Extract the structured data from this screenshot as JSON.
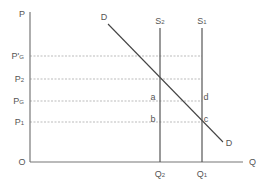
{
  "chart_data": {
    "type": "line",
    "title": "",
    "xlabel": "Q",
    "ylabel": "P",
    "origin_label": "O",
    "grid": false,
    "y_ticks": [
      {
        "label": "P'",
        "sub": "G",
        "y": 56
      },
      {
        "label": "P",
        "sub": "2",
        "y": 79
      },
      {
        "label": "P",
        "sub": "G",
        "y": 101
      },
      {
        "label": "P",
        "sub": "1",
        "y": 122
      }
    ],
    "x_ticks": [
      {
        "label": "Q",
        "sub": "2",
        "x": 160
      },
      {
        "label": "Q",
        "sub": "1",
        "x": 202
      }
    ],
    "series": [
      {
        "name": "D",
        "kind": "demand",
        "points": [
          [
            108,
            24
          ],
          [
            223,
            142
          ]
        ],
        "start_label": "D",
        "end_label": "D"
      },
      {
        "name": "S2",
        "kind": "supply",
        "x": 160,
        "label": "S",
        "sub": "2"
      },
      {
        "name": "S1",
        "kind": "supply",
        "x": 202,
        "label": "S",
        "sub": "1"
      }
    ],
    "annotations": [
      {
        "text": "a",
        "x": 153,
        "y": 100
      },
      {
        "text": "b",
        "x": 153,
        "y": 122
      },
      {
        "text": "c",
        "x": 206,
        "y": 122
      },
      {
        "text": "d",
        "x": 206,
        "y": 100
      }
    ],
    "axes": {
      "origin": [
        30,
        162
      ],
      "x_end": 243,
      "y_top": 12
    },
    "colors": {
      "axis": "#777777",
      "line": "#444444",
      "guide": "#aaaaaa",
      "text": "#555555"
    }
  }
}
